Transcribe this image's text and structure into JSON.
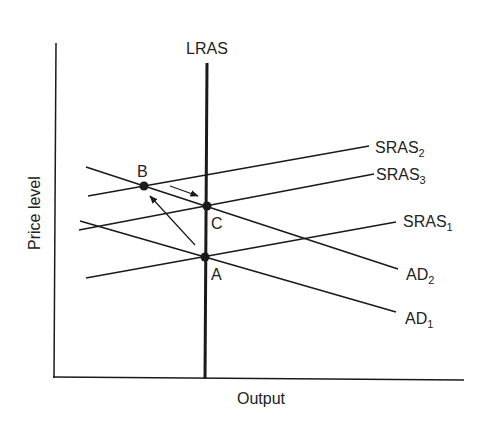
{
  "title": "",
  "axes": {
    "x_label": "Output",
    "y_label": "Price level"
  },
  "curves": {
    "lras": {
      "label": "LRAS"
    },
    "sras2": {
      "label": "SRAS",
      "sub": "2"
    },
    "sras3": {
      "label": "SRAS",
      "sub": "3"
    },
    "sras1": {
      "label": "SRAS",
      "sub": "1"
    },
    "ad2": {
      "label": "AD",
      "sub": "2"
    },
    "ad1": {
      "label": "AD",
      "sub": "1"
    }
  },
  "points": {
    "a": "A",
    "b": "B",
    "c": "C"
  },
  "colors": {
    "line": "#1a1a1a",
    "background": "#ffffff"
  }
}
